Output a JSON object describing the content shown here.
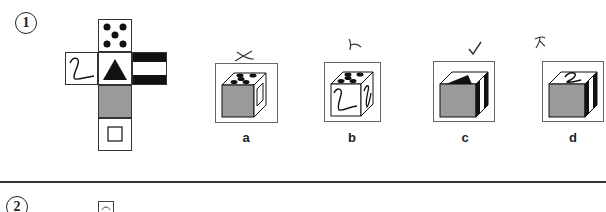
{
  "question1": {
    "number": "1",
    "net": {
      "faces": [
        {
          "position": "top",
          "symbol": "five-dots"
        },
        {
          "position": "left",
          "symbol": "z-curve"
        },
        {
          "position": "center",
          "symbol": "black-triangle"
        },
        {
          "position": "right",
          "symbol": "black-white-stripes"
        },
        {
          "position": "below-center",
          "symbol": "gray-fill"
        },
        {
          "position": "bottom",
          "symbol": "hollow-square"
        }
      ]
    },
    "options": [
      {
        "label": "a",
        "mark": "✗",
        "faces": {
          "top": "five-dots",
          "front": "gray-fill",
          "side": "hollow-square"
        }
      },
      {
        "label": "b",
        "mark": "✗",
        "faces": {
          "top": "five-dots",
          "front": "z-curve",
          "side": "z-curve"
        }
      },
      {
        "label": "c",
        "mark": "✓",
        "faces": {
          "top": "black-triangle",
          "front": "gray-fill",
          "side": "black-white-stripes"
        }
      },
      {
        "label": "d",
        "mark": "✗",
        "faces": {
          "top": "z-curve",
          "front": "gray-fill",
          "side": "black-white-stripes"
        }
      }
    ]
  },
  "question2": {
    "number": "2"
  },
  "colors": {
    "gray_face": "#9a9a9a",
    "ink": "#222222",
    "box_border": "#666666"
  }
}
